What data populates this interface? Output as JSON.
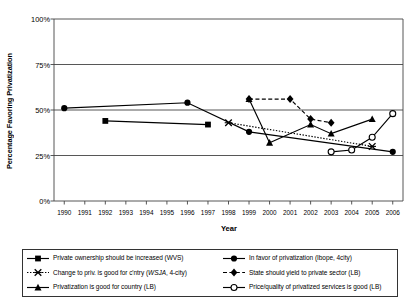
{
  "chart_data": {
    "type": "line",
    "title": "",
    "xlabel": "Year",
    "ylabel": "Percentage Favoring Privatization",
    "xlim": [
      1989.5,
      2006.5
    ],
    "ylim": [
      0,
      100
    ],
    "yticks": [
      "0%",
      "25%",
      "50%",
      "75%",
      "100%"
    ],
    "ytick_values": [
      0,
      25,
      50,
      75,
      100
    ],
    "xticks": [
      "1990",
      "1991",
      "1992",
      "1993",
      "1994",
      "1995",
      "1996",
      "1997",
      "1998",
      "1999",
      "2000",
      "2001",
      "2002",
      "2003",
      "2004",
      "2005",
      "2006"
    ],
    "grid": "horizontal",
    "legend_position": "bottom",
    "series": [
      {
        "name": "Private ownership should be increased (WVS)",
        "marker": "filled-square",
        "line": "solid",
        "x": [
          1992,
          1997
        ],
        "values": [
          44,
          42
        ]
      },
      {
        "name": "In favor of privatization (Ibope, 4city)",
        "marker": "filled-circle",
        "line": "solid",
        "x": [
          1990,
          1996,
          1999,
          2006
        ],
        "values": [
          51,
          54,
          38,
          27
        ]
      },
      {
        "name": "Change to priv. is good for c'ntry (WSJA, 4-city)",
        "marker": "cross-x",
        "line": "dotted",
        "x": [
          1998,
          2005
        ],
        "values": [
          43,
          30
        ]
      },
      {
        "name": "State should yield to private sector (LB)",
        "marker": "filled-diamond",
        "line": "dashed",
        "x": [
          1999,
          2001,
          2002,
          2003
        ],
        "values": [
          56,
          56,
          45,
          43
        ]
      },
      {
        "name": "Privatization is good for country (LB)",
        "marker": "filled-triangle",
        "line": "solid",
        "x": [
          1999,
          2000,
          2002,
          2003,
          2005
        ],
        "values": [
          56,
          32,
          42,
          37,
          45
        ]
      },
      {
        "name": "Price/quality of privatized services is good (LB)",
        "marker": "open-circle",
        "line": "solid",
        "x": [
          2003,
          2004,
          2005,
          2006
        ],
        "values": [
          27,
          28,
          35,
          48
        ]
      }
    ]
  }
}
